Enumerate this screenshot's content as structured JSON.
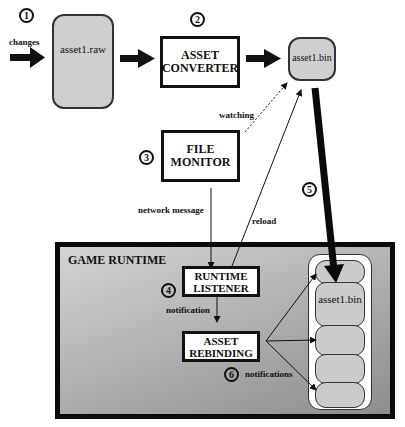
{
  "diagram": {
    "steps": {
      "step1": "1",
      "step2": "2",
      "step3": "3",
      "step4": "4",
      "step5": "5",
      "step6": "6"
    },
    "labels": {
      "changes": "changes",
      "watching": "watching",
      "network_message": "network message",
      "reload": "reload",
      "notification": "notification",
      "notifications": "notifications"
    },
    "nodes": {
      "asset_raw": "asset1.raw",
      "asset_converter_line1": "ASSET",
      "asset_converter_line2": "CONVERTER",
      "asset_bin": "asset1.bin",
      "file_monitor_line1": "FILE",
      "file_monitor_line2": "MONITOR",
      "game_runtime": "GAME RUNTIME",
      "runtime_listener_line1": "RUNTIME",
      "runtime_listener_line2": "LISTENER",
      "asset_rebinding_line1": "ASSET",
      "asset_rebinding_line2": "REBINDING",
      "runtime_asset_bin": "asset1.bin"
    },
    "colors": {
      "file_fill": "#cfcfcf",
      "runtime_gradient_light": "#d4d4d4",
      "runtime_gradient_dark": "#8e8e8e",
      "stroke": "#111111"
    }
  }
}
